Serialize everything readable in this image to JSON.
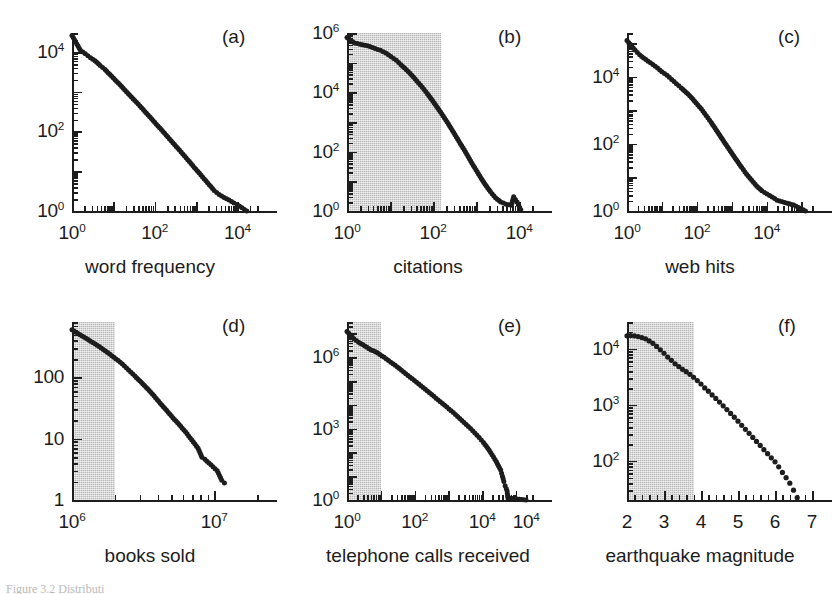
{
  "figure": {
    "caption_partial": "Figure 3.2  Distributi",
    "background": "#ffffff",
    "ink_color": "#1d1d1d",
    "shade_color": "#b9b9b9"
  },
  "chart_data": [
    {
      "id": "a",
      "type": "scatter",
      "panel_letter": "(a)",
      "title": "",
      "xlabel": "word frequency",
      "ylabel": "",
      "xscale": "log",
      "yscale": "log",
      "xlim": [
        1,
        30000
      ],
      "ylim": [
        1,
        30000
      ],
      "xticks": [
        "10<sup>0</sup>",
        "10<sup>2</sup>",
        "10<sup>4</sup>"
      ],
      "xtick_values": [
        1,
        100,
        10000
      ],
      "yticks": [
        "10<sup>0</sup>",
        "10<sup>2</sup>",
        "10<sup>4</sup>"
      ],
      "ytick_values": [
        1,
        100,
        10000
      ],
      "grid": false,
      "shaded_region": null,
      "x": [
        1,
        1.6,
        2.1,
        2.8,
        3.6,
        4.8,
        6.3,
        8.3,
        11,
        14.5,
        19,
        25,
        33,
        44,
        58,
        76,
        100,
        132,
        174,
        229,
        302,
        398,
        525,
        692,
        912,
        1202,
        1585,
        2089,
        2754,
        3631,
        4786,
        6310,
        8318,
        10000,
        13000,
        17000
      ],
      "y": [
        26000,
        11000,
        9000,
        7200,
        6000,
        4600,
        3600,
        2700,
        2000,
        1500,
        1100,
        820,
        600,
        440,
        320,
        235,
        170,
        124,
        90,
        65,
        47,
        34,
        24.5,
        17.5,
        12.5,
        9,
        6.4,
        4.6,
        3.3,
        2.6,
        2.2,
        1.9,
        1.6,
        1.45,
        1.2,
        1.0
      ]
    },
    {
      "id": "b",
      "type": "scatter",
      "panel_letter": "(b)",
      "title": "",
      "xlabel": "citations",
      "ylabel": "",
      "xscale": "log",
      "yscale": "log",
      "xlim": [
        1,
        20000
      ],
      "ylim": [
        1,
        1000000
      ],
      "xticks": [
        "10<sup>0</sup>",
        "10<sup>2</sup>",
        "10<sup>4</sup>"
      ],
      "xtick_values": [
        1,
        100,
        10000
      ],
      "yticks": [
        "10<sup>0</sup>",
        "10<sup>2</sup>",
        "10<sup>4</sup>",
        "10<sup>6</sup>"
      ],
      "ytick_values": [
        1,
        100,
        10000,
        1000000
      ],
      "grid": false,
      "shaded_region": {
        "x_from": 1,
        "x_to": 150
      },
      "x": [
        1,
        1.5,
        2,
        2.6,
        3.4,
        4.5,
        6,
        8,
        10.5,
        14,
        18,
        24,
        32,
        42,
        56,
        74,
        98,
        130,
        172,
        228,
        302,
        400,
        530,
        700,
        925,
        1225,
        1620,
        2150,
        2840,
        3760,
        5000,
        6600,
        7500,
        9000,
        11000
      ],
      "y": [
        700000,
        460000,
        420000,
        390000,
        350000,
        300000,
        260000,
        210000,
        160000,
        120000,
        85000,
        58000,
        38000,
        24000,
        15000,
        9000,
        5200,
        2900,
        1600,
        850,
        440,
        225,
        115,
        58,
        29,
        15,
        8,
        4.5,
        2.8,
        2.0,
        1.7,
        1.55,
        3.0,
        2.0,
        1.1
      ]
    },
    {
      "id": "c",
      "type": "scatter",
      "panel_letter": "(c)",
      "title": "",
      "xlabel": "web hits",
      "ylabel": "",
      "xscale": "log",
      "yscale": "log",
      "xlim": [
        1,
        200000
      ],
      "ylim": [
        1,
        200000
      ],
      "xticks": [
        "10<sup>0</sup>",
        "10<sup>2</sup>",
        "10<sup>4</sup>"
      ],
      "xtick_values": [
        1,
        100,
        10000
      ],
      "yticks": [
        "10<sup>0</sup>",
        "10<sup>2</sup>",
        "10<sup>4</sup>"
      ],
      "ytick_values": [
        1,
        100,
        10000
      ],
      "grid": false,
      "shaded_region": null,
      "x": [
        1,
        1.7,
        2.3,
        3,
        4,
        5.5,
        7.5,
        10,
        14,
        19,
        26,
        36,
        50,
        70,
        96,
        134,
        185,
        260,
        360,
        500,
        700,
        980,
        1370,
        1920,
        2680,
        3750,
        5250,
        7350,
        10300,
        14400,
        20000,
        28000,
        39000,
        60000,
        130000
      ],
      "y": [
        120000,
        62000,
        45000,
        36000,
        29000,
        23000,
        18000,
        14000,
        11000,
        8300,
        6200,
        4600,
        3400,
        2400,
        1650,
        1100,
        700,
        430,
        260,
        155,
        92,
        55,
        33,
        20,
        12.5,
        8.2,
        5.5,
        4.0,
        3.2,
        2.6,
        2.1,
        1.9,
        1.7,
        1.5,
        1.0
      ]
    },
    {
      "id": "d",
      "type": "scatter",
      "panel_letter": "(d)",
      "title": "",
      "xlabel": "books sold",
      "ylabel": "",
      "xscale": "log",
      "yscale": "log",
      "xlim": [
        1000000,
        20000000
      ],
      "ylim": [
        1,
        800
      ],
      "xticks": [
        "10<sup>6</sup>",
        "10<sup>7</sup>"
      ],
      "xtick_values": [
        1000000,
        10000000
      ],
      "yticks": [
        "1",
        "10",
        "100"
      ],
      "ytick_values": [
        1,
        10,
        100
      ],
      "grid": false,
      "shaded_region": {
        "x_from": 1000000,
        "x_to": 2000000
      },
      "x": [
        1000000,
        1100000,
        1220000,
        1350000,
        1500000,
        1660000,
        1840000,
        2040000,
        2260000,
        2500000,
        2770000,
        3070000,
        3400000,
        3770000,
        4170000,
        4620000,
        5120000,
        5670000,
        6280000,
        6960000,
        7700000,
        8200000,
        8600000,
        9800000,
        10500000,
        11300000,
        11800000
      ],
      "y": [
        600,
        520,
        450,
        390,
        335,
        285,
        240,
        200,
        165,
        132,
        105,
        83,
        65,
        50,
        38,
        29,
        22,
        17,
        13,
        9.5,
        7.0,
        5.0,
        4.6,
        3.5,
        3.0,
        2.1,
        1.9
      ]
    },
    {
      "id": "e",
      "type": "scatter",
      "panel_letter": "(e)",
      "title": "",
      "xlabel": "telephone calls received",
      "ylabel": "",
      "xscale": "log",
      "yscale": "log",
      "xlim": [
        1,
        300000
      ],
      "ylim": [
        1,
        30000000
      ],
      "xticks": [
        "10<sup>0</sup>",
        "10<sup>2</sup>",
        "10<sup>4</sup>",
        "10<sup>4</sup>"
      ],
      "xtick_values": [
        1,
        100,
        10000,
        200000
      ],
      "yticks": [
        "10<sup>0</sup>",
        "10<sup>3</sup>",
        "10<sup>6</sup>"
      ],
      "ytick_values": [
        1,
        1000,
        1000000
      ],
      "grid": false,
      "shaded_region": {
        "x_from": 1,
        "x_to": 10
      },
      "x": [
        1,
        1.6,
        2.2,
        2.9,
        3.9,
        5.2,
        7,
        9.4,
        12.6,
        17,
        23,
        31,
        41,
        55,
        74,
        99,
        133,
        179,
        240,
        322,
        432,
        580,
        778,
        1044,
        1400,
        1880,
        2520,
        3380,
        4540,
        6090,
        8170,
        10960,
        14700,
        19700,
        26500,
        35500,
        40000,
        44000,
        48000,
        52000,
        55000,
        58000,
        200000
      ],
      "y": [
        12000000,
        6000000,
        4200000,
        3400000,
        2600000,
        2000000,
        1700000,
        1300000,
        980000,
        720000,
        530000,
        390000,
        280000,
        200000,
        145000,
        105000,
        75000,
        53000,
        38000,
        27000,
        19000,
        13500,
        9500,
        6700,
        4700,
        3200,
        2200,
        1500,
        1000,
        650,
        420,
        260,
        150,
        80,
        40,
        18,
        10,
        6,
        4,
        3,
        2.4,
        1.2,
        1.0
      ]
    },
    {
      "id": "f",
      "type": "scatter",
      "panel_letter": "(f)",
      "title": "",
      "xlabel": "earthquake magnitude",
      "ylabel": "",
      "xscale": "linear",
      "yscale": "log",
      "xlim": [
        2,
        7
      ],
      "ylim": [
        20,
        30000
      ],
      "xticks": [
        "2",
        "3",
        "4",
        "5",
        "6",
        "7"
      ],
      "xtick_values": [
        2,
        3,
        4,
        5,
        6,
        7
      ],
      "yticks": [
        "10<sup>2</sup>",
        "10<sup>3</sup>",
        "10<sup>4</sup>"
      ],
      "ytick_values": [
        100,
        1000,
        10000
      ],
      "grid": false,
      "shaded_region": {
        "x_from": 2,
        "x_to": 3.8
      },
      "x": [
        2.0,
        2.1,
        2.2,
        2.3,
        2.4,
        2.5,
        2.6,
        2.7,
        2.8,
        2.9,
        3.0,
        3.1,
        3.2,
        3.3,
        3.4,
        3.5,
        3.6,
        3.7,
        3.8,
        3.9,
        4.0,
        4.1,
        4.2,
        4.3,
        4.4,
        4.5,
        4.6,
        4.7,
        4.8,
        4.9,
        5.0,
        5.1,
        5.2,
        5.3,
        5.4,
        5.5,
        5.6,
        5.7,
        5.8,
        5.9,
        6.0,
        6.1,
        6.2,
        6.3,
        6.4,
        6.5,
        6.6
      ],
      "y": [
        17000,
        17200,
        17000,
        16500,
        15800,
        15000,
        13800,
        12500,
        11000,
        9600,
        8300,
        7100,
        6200,
        5400,
        4800,
        4300,
        3900,
        3500,
        3100,
        2700,
        2350,
        2000,
        1750,
        1500,
        1300,
        1120,
        960,
        820,
        700,
        600,
        510,
        430,
        365,
        310,
        262,
        222,
        188,
        158,
        134,
        113,
        96,
        78,
        62,
        50,
        40,
        30,
        22
      ]
    }
  ]
}
